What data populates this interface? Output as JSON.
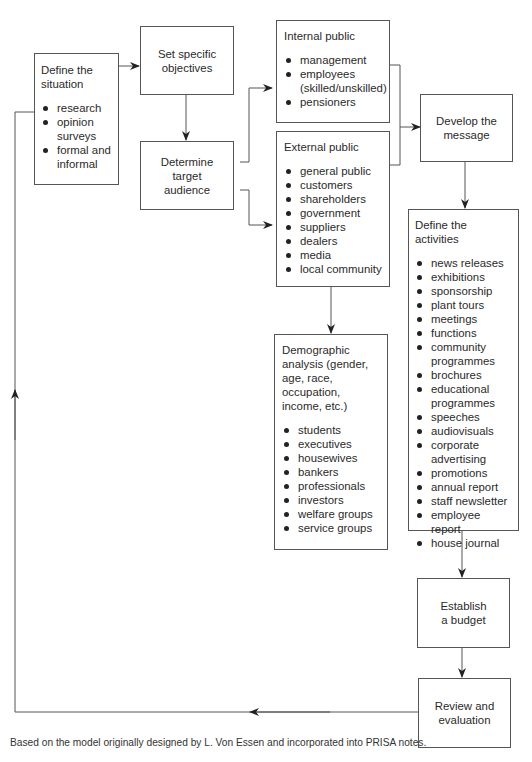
{
  "diagram": {
    "type": "flowchart",
    "nodes": {
      "define_situation": {
        "title_lines": [
          "Define the",
          "situation"
        ],
        "items": [
          "research",
          "opinion surveys",
          "formal and informal"
        ]
      },
      "set_objectives": {
        "title_lines": [
          "Set specific",
          "objectives"
        ]
      },
      "target_audience": {
        "title_lines": [
          "Determine",
          "target",
          "audience"
        ]
      },
      "internal_public": {
        "title": "Internal public",
        "items": [
          "management",
          "employees (skilled/unskilled)",
          "pensioners"
        ]
      },
      "external_public": {
        "title": "External public",
        "items": [
          "general public",
          "customers",
          "shareholders",
          "government",
          "suppliers",
          "dealers",
          "media",
          "local community"
        ]
      },
      "demographic": {
        "title": "Demographic analysis (gender, age, race, occupation, income, etc.)",
        "items": [
          "students",
          "executives",
          "housewives",
          "bankers",
          "professionals",
          "investors",
          "welfare groups",
          "service groups"
        ]
      },
      "develop_message": {
        "title_lines": [
          "Develop the",
          "message"
        ]
      },
      "define_activities": {
        "title": "Define the activities",
        "items": [
          "news releases",
          "exhibitions",
          "sponsorship",
          "plant tours",
          "meetings",
          "functions",
          "community programmes",
          "brochures",
          "educational programmes",
          "speeches",
          "audiovisuals",
          "corporate advertising",
          "promotions",
          "annual report",
          "staff newsletter",
          "employee report",
          "house journal"
        ]
      },
      "establish_budget": {
        "title_lines": [
          "Establish",
          "a budget"
        ]
      },
      "review": {
        "title_lines": [
          "Review and",
          "evaluation"
        ]
      }
    },
    "edges": [
      {
        "from": "define_situation",
        "to": "set_objectives"
      },
      {
        "from": "set_objectives",
        "to": "target_audience"
      },
      {
        "from": "target_audience",
        "to": "internal_public"
      },
      {
        "from": "target_audience",
        "to": "external_public"
      },
      {
        "from": "internal_public",
        "to": "develop_message"
      },
      {
        "from": "external_public",
        "to": "develop_message"
      },
      {
        "from": "external_public",
        "to": "demographic"
      },
      {
        "from": "develop_message",
        "to": "define_activities"
      },
      {
        "from": "define_activities",
        "to": "establish_budget"
      },
      {
        "from": "establish_budget",
        "to": "review"
      },
      {
        "from": "review",
        "to": "define_situation"
      }
    ],
    "caption": "Based on the model originally designed by L. Von Essen and incorporated into PRISA notes."
  }
}
